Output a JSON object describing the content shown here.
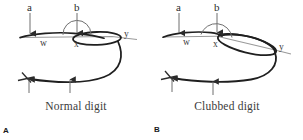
{
  "figure": {
    "background_color": "#ffffff",
    "ink_color": "#222222",
    "guide_color": "#8d8d8d"
  },
  "panels": [
    {
      "letter": "A",
      "caption": "Normal digit",
      "labels": {
        "angle_a": "a",
        "angle_b": "b",
        "point_w": "w",
        "point_x": "x",
        "point_y": "y"
      }
    },
    {
      "letter": "B",
      "caption": "Clubbed digit",
      "labels": {
        "angle_a": "a",
        "angle_b": "b",
        "point_w": "w",
        "point_x": "x",
        "point_y": "y"
      }
    }
  ]
}
